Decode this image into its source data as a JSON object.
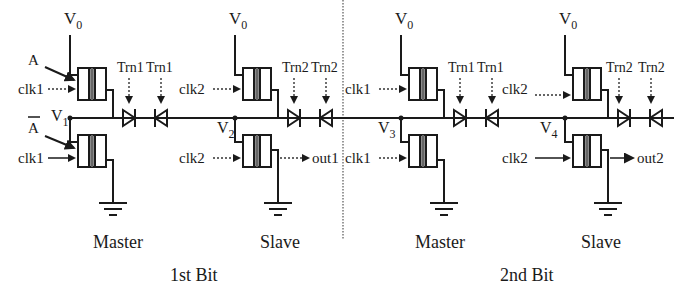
{
  "figure": {
    "supply_label": "V",
    "supply_sub": "0",
    "sections": [
      {
        "id": "bit1",
        "caption": "1st Bit",
        "stages": [
          {
            "name": "Master",
            "clock": "clk1",
            "node_label": "V",
            "node_sub": "1",
            "diode_control": "Trn1",
            "inputs": [
              "A",
              "A"
            ],
            "output": null
          },
          {
            "name": "Slave",
            "clock": "clk2",
            "node_label": "V",
            "node_sub": "2",
            "diode_control": "Trn2",
            "inputs": [],
            "output": "out1"
          }
        ]
      },
      {
        "id": "bit2",
        "caption": "2nd Bit",
        "stages": [
          {
            "name": "Master",
            "clock": "clk1",
            "node_label": "V",
            "node_sub": "3",
            "diode_control": "Trn1",
            "inputs": [],
            "output": null
          },
          {
            "name": "Slave",
            "clock": "clk2",
            "node_label": "V",
            "node_sub": "4",
            "diode_control": "Trn2",
            "inputs": [],
            "output": "out2"
          }
        ]
      }
    ],
    "input_A": "A",
    "input_A_bar": "A"
  },
  "labels": {
    "s0": {
      "name": "Master",
      "clk": "clk1",
      "trn": "Trn1",
      "v": "V",
      "vsub": "1",
      "vdd": "V",
      "vddsub": "0"
    },
    "s1": {
      "name": "Slave",
      "clk": "clk2",
      "trn": "Trn2",
      "v": "V",
      "vsub": "2",
      "vdd": "V",
      "vddsub": "0",
      "out": "out1"
    },
    "s2": {
      "name": "Master",
      "clk": "clk1",
      "trn": "Trn1",
      "v": "V",
      "vsub": "3",
      "vdd": "V",
      "vddsub": "0"
    },
    "s3": {
      "name": "Slave",
      "clk": "clk2",
      "trn": "Trn2",
      "v": "V",
      "vsub": "4",
      "vdd": "V",
      "vddsub": "0",
      "out": "out2"
    },
    "bit1": "1st Bit",
    "bit2": "2nd Bit",
    "A": "A",
    "Abar": "A"
  }
}
